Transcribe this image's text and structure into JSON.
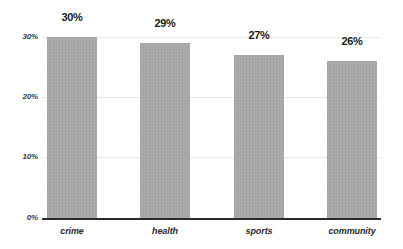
{
  "chart_data": {
    "type": "bar",
    "title": "",
    "subtitle": "",
    "xlabel": "",
    "ylabel": "",
    "categories": [
      "crime",
      "health",
      "sports",
      "community"
    ],
    "values": [
      30,
      29,
      27,
      26
    ],
    "value_labels": [
      "30%",
      "29%",
      "27%",
      "26%"
    ],
    "ylim": [
      0,
      30
    ],
    "ytick_values": [
      0,
      10,
      20,
      30
    ],
    "ytick_labels": [
      "0%",
      "10%",
      "20%",
      "30%"
    ],
    "grid": true,
    "legend": null,
    "legend_position": "none",
    "series": [
      {
        "name": "",
        "values": [
          30,
          29,
          27,
          26
        ],
        "color": "#a9a9a9"
      }
    ],
    "annotations": []
  },
  "colors": {
    "bar_fill": "#a9a9a9",
    "background": "#ffffff",
    "axis_line": "#2b2b2b",
    "gridline": "#e9e9e9",
    "value_label_text": "#1a1a1a",
    "tick_label_text": "#3a3a3a",
    "category_label_text": "#2b2b2b"
  }
}
